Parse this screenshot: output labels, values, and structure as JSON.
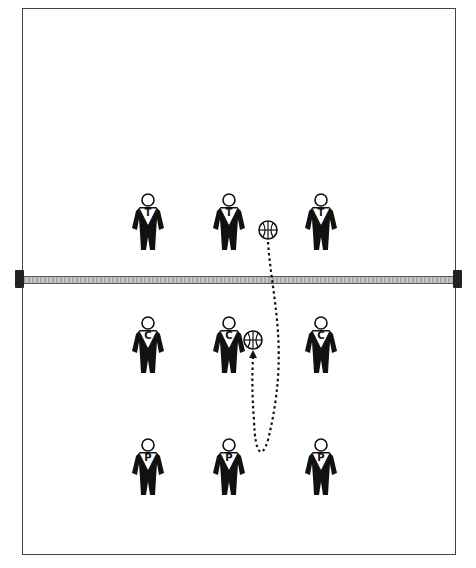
{
  "diagram": {
    "type": "volleyball-drill",
    "court": {
      "border_color": "#444444"
    },
    "net": {
      "color": "#bbbbbb"
    },
    "players": [
      {
        "label": "T",
        "row": "top",
        "x": 148,
        "y": 193
      },
      {
        "label": "T",
        "row": "top",
        "x": 229,
        "y": 193
      },
      {
        "label": "T",
        "row": "top",
        "x": 321,
        "y": 193
      },
      {
        "label": "C",
        "row": "middle",
        "x": 148,
        "y": 316
      },
      {
        "label": "C",
        "row": "middle",
        "x": 229,
        "y": 316
      },
      {
        "label": "C",
        "row": "middle",
        "x": 321,
        "y": 316
      },
      {
        "label": "P",
        "row": "bottom",
        "x": 148,
        "y": 438
      },
      {
        "label": "P",
        "row": "bottom",
        "x": 229,
        "y": 438
      },
      {
        "label": "P",
        "row": "bottom",
        "x": 321,
        "y": 438
      }
    ],
    "balls": [
      {
        "x": 268,
        "y": 230
      },
      {
        "x": 253,
        "y": 340
      }
    ],
    "path": {
      "style": "dotted",
      "from": "ball-top",
      "to": "ball-middle",
      "arrow": "end"
    }
  }
}
